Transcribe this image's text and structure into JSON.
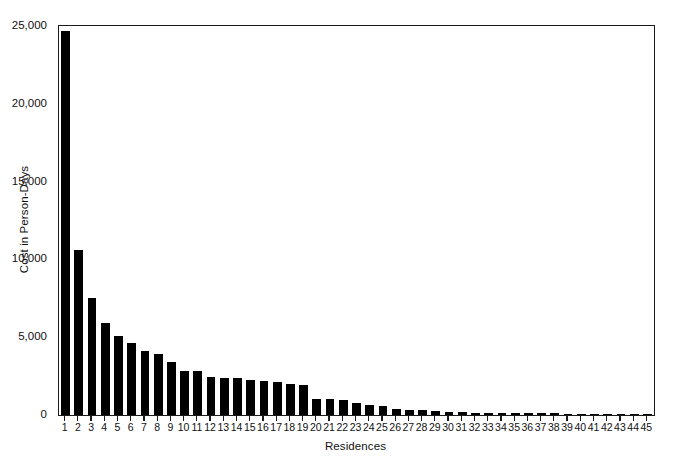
{
  "chart_data": {
    "type": "bar",
    "title": "",
    "xlabel": "Residences",
    "ylabel": "Cost in Person-Days",
    "categories": [
      "1",
      "2",
      "3",
      "4",
      "5",
      "6",
      "7",
      "8",
      "9",
      "10",
      "11",
      "12",
      "13",
      "14",
      "15",
      "16",
      "17",
      "18",
      "19",
      "20",
      "21",
      "22",
      "23",
      "24",
      "25",
      "26",
      "27",
      "28",
      "29",
      "30",
      "31",
      "32",
      "33",
      "34",
      "35",
      "36",
      "37",
      "38",
      "39",
      "40",
      "41",
      "42",
      "43",
      "44",
      "45"
    ],
    "values": [
      24700,
      10600,
      7500,
      5900,
      5100,
      4600,
      4100,
      3950,
      3400,
      2850,
      2800,
      2450,
      2400,
      2350,
      2250,
      2200,
      2100,
      2000,
      1900,
      1050,
      1000,
      950,
      800,
      650,
      550,
      400,
      350,
      300,
      250,
      200,
      180,
      160,
      150,
      140,
      130,
      120,
      110,
      100,
      95,
      90,
      85,
      80,
      75,
      70,
      65
    ],
    "ylim": [
      0,
      25000
    ],
    "yticks": [
      0,
      5000,
      10000,
      15000,
      20000,
      25000
    ],
    "ytick_labels": [
      "0",
      "5,000",
      "10,000",
      "15,000",
      "20,000",
      "25,000"
    ],
    "grid": false,
    "legend": null,
    "bar_color": "#000000",
    "axis_color": "#1a1a1a",
    "background": "#ffffff"
  }
}
